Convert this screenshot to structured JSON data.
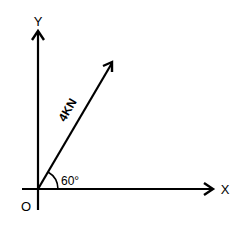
{
  "diagram": {
    "type": "force-vector",
    "axes": {
      "x_label": "X",
      "y_label": "Y",
      "origin_label": "O"
    },
    "vector": {
      "label": "4KN",
      "magnitude": "4 kN",
      "angle_label": "60°",
      "angle_degrees": 60,
      "reference": "X axis"
    },
    "colors": {
      "stroke": "#000000",
      "background": "#ffffff"
    }
  }
}
